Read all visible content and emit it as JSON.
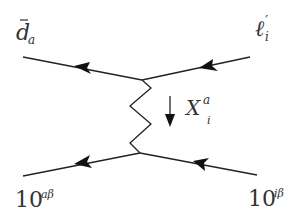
{
  "diagram": {
    "type": "feynman-diagram",
    "stroke_color": "#222222",
    "labels": {
      "top_left": {
        "base": "d",
        "bar": true,
        "subscript": "a"
      },
      "top_right": {
        "base": "ℓ",
        "prime": "′",
        "subscript": "i"
      },
      "mediator": {
        "base": "X",
        "superscript": "a",
        "subscript": "i"
      },
      "bottom_left": {
        "base": "10",
        "superscript": "aβ"
      },
      "bottom_right": {
        "base": "10",
        "superscript": "iβ"
      }
    },
    "edges": [
      {
        "name": "top-left-fermion",
        "from": [
          142,
          80
        ],
        "to": [
          23,
          57
        ],
        "arrow": "left"
      },
      {
        "name": "top-right-fermion",
        "from": [
          250,
          57
        ],
        "to": [
          142,
          80
        ],
        "arrow": "left"
      },
      {
        "name": "bottom-left-fermion",
        "from": [
          140,
          153
        ],
        "to": [
          23,
          176
        ],
        "arrow": "left"
      },
      {
        "name": "bottom-right-fermion",
        "from": [
          257,
          175
        ],
        "to": [
          140,
          153
        ],
        "arrow": "left"
      },
      {
        "name": "boson-propagator",
        "from": [
          142,
          80
        ],
        "to": [
          140,
          153
        ],
        "style": "zigzag"
      }
    ],
    "momentum_arrow": {
      "direction": "down"
    }
  }
}
